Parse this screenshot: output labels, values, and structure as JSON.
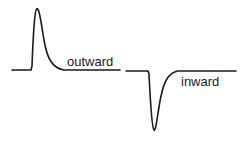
{
  "diagram": {
    "traces": [
      {
        "id": "outward",
        "label": "outward",
        "direction": "up"
      },
      {
        "id": "inward",
        "label": "inward",
        "direction": "down"
      }
    ],
    "colors": {
      "line": "#1a1a1a",
      "background": "#ffffff"
    }
  }
}
